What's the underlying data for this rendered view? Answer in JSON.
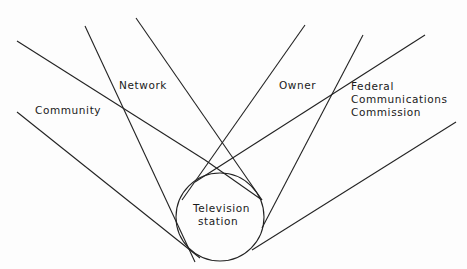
{
  "diagram": {
    "center": {
      "label_line1": "Television",
      "label_line2": "station"
    },
    "influences": [
      {
        "id": "community",
        "label": "Community"
      },
      {
        "id": "network",
        "label": "Network"
      },
      {
        "id": "owner",
        "label": "Owner"
      },
      {
        "id": "fcc",
        "label_line1": "Federal",
        "label_line2": "Communications",
        "label_line3": "Commission"
      }
    ],
    "colors": {
      "line": "#222222",
      "text": "#1a1a1a",
      "background": "#fdfdfd"
    }
  }
}
